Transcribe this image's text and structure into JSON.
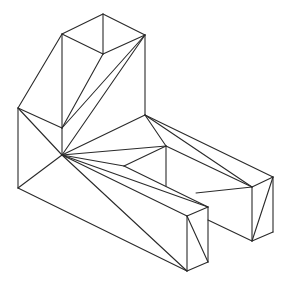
{
  "diagram": {
    "stroke_color": "#2a2a2a",
    "background": "#ffffff",
    "edges": [
      [
        103,
        14,
        62,
        34
      ],
      [
        103,
        14,
        145,
        35
      ],
      [
        62,
        34,
        103,
        54
      ],
      [
        145,
        35,
        103,
        54
      ],
      [
        103,
        14,
        103,
        54
      ],
      [
        62,
        34,
        62,
        128
      ],
      [
        62,
        34,
        18,
        108
      ],
      [
        103,
        54,
        62,
        128
      ],
      [
        145,
        35,
        62,
        128
      ],
      [
        145,
        35,
        62,
        155
      ],
      [
        145,
        35,
        145,
        115
      ],
      [
        18,
        108,
        62,
        128
      ],
      [
        18,
        108,
        62,
        155
      ],
      [
        18,
        108,
        18,
        188
      ],
      [
        62,
        128,
        62,
        155
      ],
      [
        18,
        188,
        62,
        155
      ],
      [
        18,
        188,
        187,
        271
      ],
      [
        62,
        155,
        145,
        115
      ],
      [
        62,
        155,
        166,
        146
      ],
      [
        62,
        155,
        124,
        166
      ],
      [
        62,
        155,
        208,
        207
      ],
      [
        62,
        155,
        187,
        216
      ],
      [
        62,
        155,
        187,
        271
      ],
      [
        145,
        115,
        166,
        146
      ],
      [
        145,
        115,
        252,
        187
      ],
      [
        145,
        115,
        273,
        177
      ],
      [
        166,
        146,
        252,
        187
      ],
      [
        124,
        166,
        166,
        146
      ],
      [
        124,
        166,
        208,
        207
      ],
      [
        166,
        146,
        166,
        186
      ],
      [
        196,
        193,
        252,
        187
      ],
      [
        252,
        187,
        273,
        177
      ],
      [
        252,
        187,
        252,
        241
      ],
      [
        273,
        177,
        273,
        232
      ],
      [
        252,
        241,
        273,
        232
      ],
      [
        273,
        177,
        252,
        241
      ],
      [
        208,
        220,
        252,
        241
      ],
      [
        187,
        216,
        208,
        207
      ],
      [
        187,
        216,
        187,
        271
      ],
      [
        208,
        207,
        208,
        262
      ],
      [
        187,
        271,
        208,
        262
      ],
      [
        187,
        216,
        208,
        262
      ]
    ]
  }
}
